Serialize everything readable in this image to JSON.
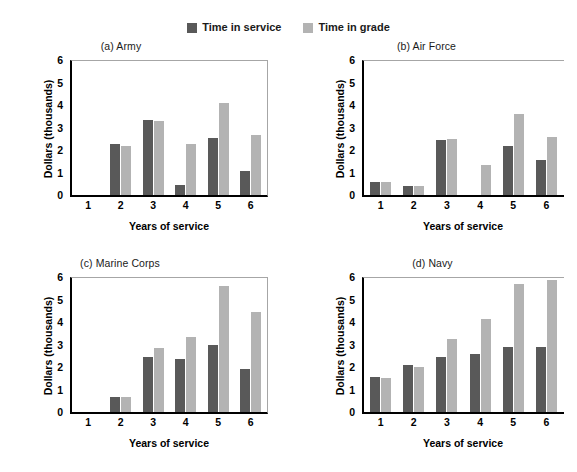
{
  "legend": {
    "entries": [
      {
        "label": "Time in service",
        "color": "#595959",
        "swatch_name": "legend-swatch-time-in-service"
      },
      {
        "label": "Time in grade",
        "color": "#b3b3b3",
        "swatch_name": "legend-swatch-time-in-grade"
      }
    ]
  },
  "axis": {
    "ylabel": "Dollars (thousands)",
    "xlabel": "Years of service",
    "yticks": [
      "0",
      "1",
      "2",
      "3",
      "4",
      "5",
      "6"
    ],
    "xticks": [
      "1",
      "2",
      "3",
      "4",
      "5",
      "6"
    ]
  },
  "chart_data": [
    {
      "type": "bar",
      "title": "(a) Army",
      "xlabel": "Years of service",
      "ylabel": "Dollars (thousands)",
      "categories": [
        "1",
        "2",
        "3",
        "4",
        "5",
        "6"
      ],
      "ylim": [
        0,
        6
      ],
      "grid": false,
      "legend_position": "top-center",
      "series": [
        {
          "name": "Time in service",
          "color": "#595959",
          "values": [
            0,
            2.25,
            3.35,
            0.45,
            2.55,
            1.05
          ]
        },
        {
          "name": "Time in grade",
          "color": "#b3b3b3",
          "values": [
            0,
            2.2,
            3.3,
            2.25,
            4.1,
            2.65
          ]
        }
      ]
    },
    {
      "type": "bar",
      "title": "(b) Air Force",
      "xlabel": "Years of service",
      "ylabel": "Dollars (thousands)",
      "categories": [
        "1",
        "2",
        "3",
        "4",
        "5",
        "6"
      ],
      "ylim": [
        0,
        6
      ],
      "grid": false,
      "legend_position": "top-center",
      "series": [
        {
          "name": "Time in service",
          "color": "#595959",
          "values": [
            0.6,
            0.4,
            2.45,
            0,
            2.2,
            1.55
          ]
        },
        {
          "name": "Time in grade",
          "color": "#b3b3b3",
          "values": [
            0.6,
            0.4,
            2.5,
            1.35,
            3.6,
            2.6
          ]
        }
      ]
    },
    {
      "type": "bar",
      "title": "(c) Marine Corps",
      "xlabel": "Years of service",
      "ylabel": "Dollars (thousands)",
      "categories": [
        "1",
        "2",
        "3",
        "4",
        "5",
        "6"
      ],
      "ylim": [
        0,
        6
      ],
      "grid": false,
      "legend_position": "top-center",
      "series": [
        {
          "name": "Time in service",
          "color": "#595959",
          "values": [
            0,
            0.65,
            2.45,
            2.35,
            3.0,
            1.9
          ]
        },
        {
          "name": "Time in grade",
          "color": "#b3b3b3",
          "values": [
            0,
            0.65,
            2.85,
            3.35,
            5.6,
            4.45
          ]
        }
      ]
    },
    {
      "type": "bar",
      "title": "(d) Navy",
      "xlabel": "Years of service",
      "ylabel": "Dollars (thousands)",
      "categories": [
        "1",
        "2",
        "3",
        "4",
        "5",
        "6"
      ],
      "ylim": [
        0,
        6
      ],
      "grid": false,
      "legend_position": "top-center",
      "series": [
        {
          "name": "Time in service",
          "color": "#595959",
          "values": [
            1.55,
            2.1,
            2.45,
            2.6,
            2.9,
            2.9
          ]
        },
        {
          "name": "Time in grade",
          "color": "#b3b3b3",
          "values": [
            1.5,
            2.0,
            3.25,
            4.15,
            5.7,
            5.85
          ]
        }
      ]
    }
  ]
}
